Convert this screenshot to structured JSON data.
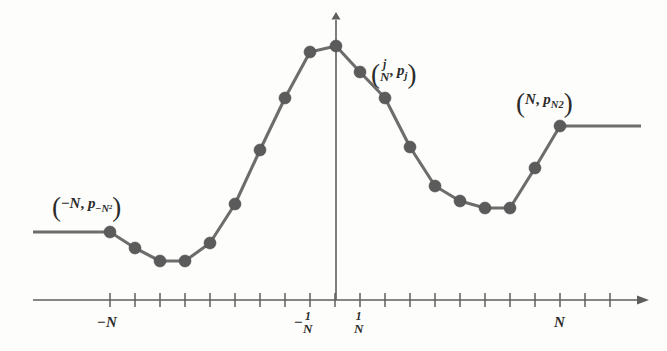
{
  "figure": {
    "name": "piecewise-linear-probability-plot",
    "background_color": "#fdfdfb",
    "line_color": "#6d6d6d",
    "marker_color": "#5b5b5b",
    "axis_color": "#5e5e5e"
  },
  "axes": {
    "x_axis": {
      "y_pixel": 300,
      "x_start": 33,
      "x_end": 641,
      "arrow": "right",
      "tick_count": 21,
      "tick_spacing_px": 25,
      "first_tick_x": 110
    },
    "y_axis": {
      "x_pixel": 336,
      "y_top": 20,
      "y_bottom": 300,
      "arrow": "up"
    },
    "tick_labels": [
      {
        "id": "tick-label-minus-N",
        "text": "-N",
        "x": 110,
        "latex": "-N"
      },
      {
        "id": "tick-label-minus-one-over-N",
        "text": "-1/N",
        "numerator": "1",
        "denominator": "N",
        "sign": "-",
        "x": 310
      },
      {
        "id": "tick-label-one-over-N",
        "text": "1/N",
        "numerator": "1",
        "denominator": "N",
        "sign": "",
        "x": 360
      },
      {
        "id": "tick-label-N",
        "text": "N",
        "x": 560,
        "latex": "N"
      }
    ]
  },
  "annotations": [
    {
      "id": "annotation-left-endpoint",
      "text": "(-N, p_{-N^2})",
      "variable": "N",
      "sign": "-",
      "p_symbol": "p",
      "subscript": "-N",
      "subscript_exponent": "2",
      "x": 52,
      "y": 196,
      "anchors_point_index": 0
    },
    {
      "id": "annotation-generic-point",
      "text": "(j/N, p_j)",
      "numerator": "j",
      "denominator": "N",
      "p_symbol": "p",
      "subscript": "j",
      "x": 371,
      "y": 60,
      "anchors_point_index": 14
    },
    {
      "id": "annotation-right-endpoint",
      "text": "(N, p_{N^2})",
      "variable": "N",
      "p_symbol": "p",
      "subscript": "N",
      "subscript_exponent": "2",
      "x": 516,
      "y": 92,
      "anchors_point_index": 21
    }
  ],
  "chart_data": {
    "type": "line",
    "title": "",
    "xlabel": "",
    "ylabel": "",
    "grid": false,
    "legend": false,
    "marker": "filled-circle",
    "marker_radius_px": 6,
    "xlim": [
      33,
      641
    ],
    "ylim": [
      300,
      20
    ],
    "note": "Values are pixel coordinates of the polyline vertices, read off the figure; x increases rightward, y increases downward.",
    "x": [
      110,
      135,
      160,
      185,
      210,
      235,
      260,
      285,
      310,
      336,
      360,
      385,
      410,
      435,
      460,
      485,
      510,
      535,
      560
    ],
    "y": [
      232,
      248,
      261,
      261,
      243,
      204,
      150,
      98,
      52,
      46,
      72,
      98,
      147,
      186,
      201,
      208,
      208,
      168,
      126
    ],
    "tails": [
      {
        "id": "left-tail",
        "from_x": 33,
        "to_x": 110,
        "y": 232
      },
      {
        "id": "right-tail",
        "from_x": 560,
        "to_x": 641,
        "y": 126
      }
    ]
  }
}
